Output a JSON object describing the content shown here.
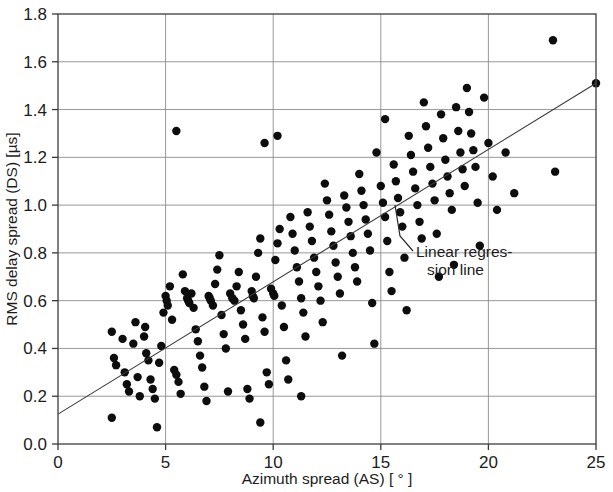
{
  "chart_data": {
    "type": "scatter",
    "title": "",
    "xlabel": "Azimuth spread (AS) [ ° ]",
    "ylabel": "RMS delay spread (DS) [µs]",
    "xlim": [
      0,
      25
    ],
    "ylim": [
      0.0,
      1.8
    ],
    "xticks": [
      "0",
      "5",
      "10",
      "15",
      "20",
      "25"
    ],
    "xtick_values": [
      0,
      5,
      10,
      15,
      20,
      25
    ],
    "yticks": [
      "0.0",
      "0.2",
      "0.4",
      "0.6",
      "0.8",
      "1.0",
      "1.2",
      "1.4",
      "1.6",
      "1.8"
    ],
    "ytick_values": [
      0.0,
      0.2,
      0.4,
      0.6,
      0.8,
      1.0,
      1.2,
      1.4,
      1.6,
      1.8
    ],
    "grid": true,
    "legend": "none",
    "marker": "filled-circle",
    "marker_color": "#0d0d0d",
    "annotations": [
      {
        "name": "regression-annotation",
        "line1": "Linear regres-",
        "line2": "sion line",
        "points_to": "linear-regression-line"
      }
    ],
    "series": [
      {
        "name": "RMS delay spread vs azimuth spread",
        "points": [
          [
            2.5,
            0.47
          ],
          [
            2.6,
            0.36
          ],
          [
            2.7,
            0.33
          ],
          [
            2.5,
            0.11
          ],
          [
            3.0,
            0.44
          ],
          [
            3.1,
            0.3
          ],
          [
            3.2,
            0.25
          ],
          [
            3.3,
            0.22
          ],
          [
            3.5,
            0.42
          ],
          [
            3.6,
            0.51
          ],
          [
            3.7,
            0.28
          ],
          [
            3.8,
            0.2
          ],
          [
            4.0,
            0.45
          ],
          [
            4.05,
            0.49
          ],
          [
            4.1,
            0.38
          ],
          [
            4.2,
            0.35
          ],
          [
            4.3,
            0.27
          ],
          [
            4.4,
            0.23
          ],
          [
            4.5,
            0.19
          ],
          [
            4.6,
            0.07
          ],
          [
            4.7,
            0.34
          ],
          [
            4.8,
            0.41
          ],
          [
            4.9,
            0.55
          ],
          [
            5.0,
            0.62
          ],
          [
            5.05,
            0.6
          ],
          [
            5.1,
            0.58
          ],
          [
            5.2,
            0.66
          ],
          [
            5.3,
            0.52
          ],
          [
            5.4,
            0.31
          ],
          [
            5.5,
            0.29
          ],
          [
            5.6,
            0.26
          ],
          [
            5.7,
            0.21
          ],
          [
            5.5,
            1.31
          ],
          [
            5.8,
            0.71
          ],
          [
            5.9,
            0.64
          ],
          [
            6.0,
            0.61
          ],
          [
            6.05,
            0.6
          ],
          [
            6.1,
            0.59
          ],
          [
            6.2,
            0.63
          ],
          [
            6.3,
            0.57
          ],
          [
            6.4,
            0.48
          ],
          [
            6.5,
            0.43
          ],
          [
            6.6,
            0.37
          ],
          [
            6.7,
            0.32
          ],
          [
            6.8,
            0.24
          ],
          [
            6.9,
            0.18
          ],
          [
            7.0,
            0.62
          ],
          [
            7.05,
            0.61
          ],
          [
            7.1,
            0.6
          ],
          [
            7.2,
            0.58
          ],
          [
            7.3,
            0.67
          ],
          [
            7.4,
            0.73
          ],
          [
            7.5,
            0.79
          ],
          [
            7.6,
            0.54
          ],
          [
            7.7,
            0.46
          ],
          [
            7.8,
            0.4
          ],
          [
            7.9,
            0.22
          ],
          [
            8.0,
            0.63
          ],
          [
            8.1,
            0.61
          ],
          [
            8.2,
            0.6
          ],
          [
            8.3,
            0.66
          ],
          [
            8.4,
            0.72
          ],
          [
            8.5,
            0.56
          ],
          [
            8.6,
            0.5
          ],
          [
            8.7,
            0.44
          ],
          [
            8.8,
            0.23
          ],
          [
            8.9,
            0.19
          ],
          [
            9.0,
            0.64
          ],
          [
            9.05,
            0.62
          ],
          [
            9.1,
            0.61
          ],
          [
            9.2,
            0.7
          ],
          [
            9.3,
            0.8
          ],
          [
            9.4,
            0.86
          ],
          [
            9.5,
            0.53
          ],
          [
            9.6,
            0.47
          ],
          [
            9.7,
            0.3
          ],
          [
            9.8,
            0.25
          ],
          [
            9.4,
            0.09
          ],
          [
            9.6,
            1.26
          ],
          [
            9.9,
            0.65
          ],
          [
            10.0,
            0.63
          ],
          [
            10.05,
            0.62
          ],
          [
            10.1,
            0.77
          ],
          [
            10.2,
            0.84
          ],
          [
            10.3,
            0.9
          ],
          [
            10.4,
            0.58
          ],
          [
            10.5,
            0.49
          ],
          [
            10.6,
            0.35
          ],
          [
            10.7,
            0.27
          ],
          [
            10.2,
            1.29
          ],
          [
            10.8,
            0.95
          ],
          [
            10.9,
            0.88
          ],
          [
            11.0,
            0.81
          ],
          [
            11.1,
            0.74
          ],
          [
            11.2,
            0.68
          ],
          [
            11.3,
            0.61
          ],
          [
            11.4,
            0.55
          ],
          [
            11.5,
            0.45
          ],
          [
            11.3,
            0.2
          ],
          [
            11.6,
            0.97
          ],
          [
            11.7,
            0.91
          ],
          [
            11.8,
            0.85
          ],
          [
            11.9,
            0.78
          ],
          [
            12.0,
            0.72
          ],
          [
            12.1,
            0.66
          ],
          [
            12.2,
            0.6
          ],
          [
            12.3,
            0.51
          ],
          [
            12.4,
            1.09
          ],
          [
            12.5,
            1.02
          ],
          [
            12.6,
            0.96
          ],
          [
            12.7,
            0.89
          ],
          [
            12.8,
            0.83
          ],
          [
            12.9,
            0.76
          ],
          [
            13.0,
            0.7
          ],
          [
            13.1,
            0.63
          ],
          [
            13.2,
            0.37
          ],
          [
            13.3,
            1.04
          ],
          [
            13.4,
            0.99
          ],
          [
            13.5,
            0.93
          ],
          [
            13.6,
            0.87
          ],
          [
            13.7,
            0.8
          ],
          [
            13.8,
            0.74
          ],
          [
            13.9,
            0.68
          ],
          [
            14.0,
            1.13
          ],
          [
            14.1,
            1.06
          ],
          [
            14.2,
            1.0
          ],
          [
            14.3,
            0.94
          ],
          [
            14.4,
            0.88
          ],
          [
            14.5,
            0.81
          ],
          [
            14.6,
            0.59
          ],
          [
            14.7,
            0.42
          ],
          [
            14.8,
            1.22
          ],
          [
            15.0,
            1.08
          ],
          [
            15.1,
            1.01
          ],
          [
            15.2,
            0.95
          ],
          [
            15.3,
            0.85
          ],
          [
            15.4,
            0.72
          ],
          [
            15.5,
            0.64
          ],
          [
            15.2,
            1.36
          ],
          [
            15.6,
            1.17
          ],
          [
            15.7,
            1.1
          ],
          [
            15.8,
            1.03
          ],
          [
            15.9,
            0.97
          ],
          [
            16.0,
            0.91
          ],
          [
            16.1,
            0.78
          ],
          [
            16.2,
            0.56
          ],
          [
            16.3,
            1.29
          ],
          [
            16.4,
            1.21
          ],
          [
            16.5,
            1.14
          ],
          [
            16.6,
            1.07
          ],
          [
            16.7,
            1.0
          ],
          [
            16.8,
            0.93
          ],
          [
            16.9,
            0.86
          ],
          [
            17.0,
            1.43
          ],
          [
            17.1,
            1.33
          ],
          [
            17.2,
            1.24
          ],
          [
            17.3,
            1.16
          ],
          [
            17.4,
            1.09
          ],
          [
            17.5,
            1.02
          ],
          [
            17.6,
            0.88
          ],
          [
            17.7,
            0.7
          ],
          [
            17.8,
            1.38
          ],
          [
            17.9,
            1.28
          ],
          [
            18.0,
            1.19
          ],
          [
            18.1,
            1.12
          ],
          [
            18.2,
            1.05
          ],
          [
            18.3,
            0.98
          ],
          [
            18.4,
            0.75
          ],
          [
            18.5,
            1.41
          ],
          [
            18.6,
            1.31
          ],
          [
            18.7,
            1.22
          ],
          [
            18.8,
            1.15
          ],
          [
            18.9,
            1.08
          ],
          [
            19.0,
            1.49
          ],
          [
            19.1,
            1.39
          ],
          [
            19.2,
            1.3
          ],
          [
            19.3,
            1.23
          ],
          [
            19.4,
            1.16
          ],
          [
            19.5,
            1.01
          ],
          [
            19.6,
            0.83
          ],
          [
            19.8,
            1.45
          ],
          [
            20.0,
            1.26
          ],
          [
            20.2,
            1.12
          ],
          [
            20.4,
            0.98
          ],
          [
            20.8,
            1.22
          ],
          [
            21.2,
            1.05
          ],
          [
            23.0,
            1.69
          ],
          [
            23.1,
            1.14
          ],
          [
            25.0,
            1.51
          ]
        ]
      }
    ],
    "regression_line": {
      "name": "linear-regression-line",
      "x_start": 0,
      "y_start": 0.125,
      "x_end": 25,
      "y_end": 1.51
    }
  },
  "axes": {
    "x_label": "Azimuth spread (AS) [ ° ]",
    "y_label": "RMS delay spread (DS) [µs]"
  },
  "colors": {
    "marker": "#0d0d0d",
    "grid": "#8c8c8c",
    "frame": "#4a4a4a",
    "regression": "#3c3c3c",
    "background": "#ffffff",
    "text": "#1c1c1c"
  }
}
